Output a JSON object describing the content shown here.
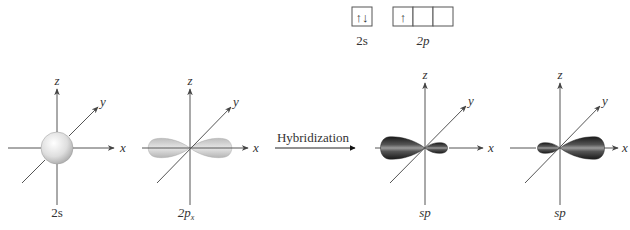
{
  "electron_config": {
    "orbitals": [
      {
        "name": "2s",
        "boxes": [
          "↑↓"
        ]
      },
      {
        "name": "2p",
        "boxes": [
          "↑",
          "",
          ""
        ]
      }
    ]
  },
  "axis_labels": {
    "x": "x",
    "y": "y",
    "z": "z"
  },
  "arrow_label": "Hybridization",
  "diagrams": [
    {
      "label": "2s",
      "label_sub": "",
      "shape": "sphere"
    },
    {
      "label": "2p",
      "label_sub": "x",
      "shape": "p-dumbbell"
    },
    {
      "label": "sp",
      "label_sub": "",
      "shape": "sp-left"
    },
    {
      "label": "sp",
      "label_sub": "",
      "shape": "sp-right"
    }
  ],
  "colors": {
    "sphere": "#d8d8d8",
    "p_lobe": "#c9c9c9",
    "sp_lobe_dark": "#2a2a2a",
    "sp_lobe_light": "#9a9a9a"
  }
}
